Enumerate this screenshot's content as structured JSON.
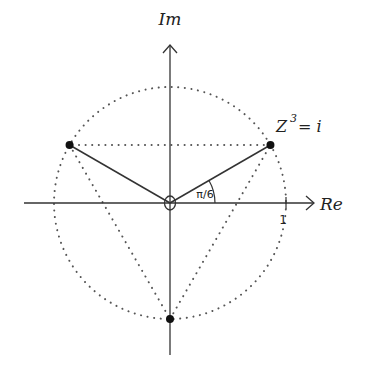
{
  "diagram": {
    "axes": {
      "x_label": "Re",
      "y_label": "Im",
      "unit_tick_label": "1"
    },
    "annotations": {
      "equation_base": "Z",
      "equation_exponent": "3",
      "equation_rest": "= i",
      "angle_label": "π/6"
    },
    "roots": [
      {
        "name": "root-right",
        "angle_deg": 30
      },
      {
        "name": "root-left",
        "angle_deg": 150
      },
      {
        "name": "root-bottom",
        "angle_deg": 270
      }
    ],
    "circle": {
      "radius_units": 1,
      "style": "dotted"
    },
    "colors": {
      "ink": "#222222",
      "dots": "#555555"
    }
  }
}
